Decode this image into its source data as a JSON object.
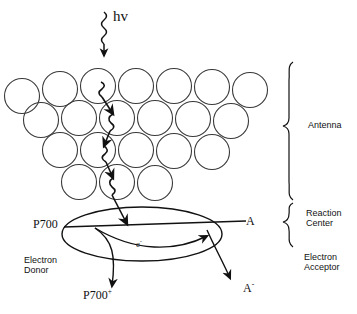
{
  "figure": {
    "background_color": "#ffffff",
    "stroke_color": "#111111"
  },
  "labels": {
    "photon": "hv",
    "p700": "P700",
    "p700_oxidized_base": "P700",
    "p700_oxidized_charge": "+",
    "acceptor": "A",
    "acceptor_reduced_base": "A",
    "acceptor_reduced_charge": "-",
    "electron_base": "e",
    "electron_charge": "-",
    "antenna": "Antenna",
    "reaction_center_line1": "Reaction",
    "reaction_center_line2": "Center",
    "electron_acceptor_line1": "Electron",
    "electron_acceptor_line2": "Acceptor",
    "electron_donor_line1": "Electron",
    "electron_donor_line2": "Donor"
  },
  "diagram_data": {
    "type": "schematic",
    "antenna": {
      "description": "Funnel-shaped array of open circles representing antenna pigment molecules",
      "circle_radius": 17.5,
      "circle_fill": "none",
      "circle_stroke": "#333333",
      "circle_stroke_width": 1.1,
      "rows": [
        {
          "row": 1,
          "count": 7,
          "cy": 96,
          "cx": [
            22,
            60,
            98,
            136,
            174,
            212,
            250
          ]
        },
        {
          "row": 2,
          "count": 6,
          "cy": 127,
          "cx": [
            41,
            79,
            117,
            155,
            193,
            231
          ]
        },
        {
          "row": 3,
          "count": 5,
          "cy": 158,
          "cx": [
            60,
            98,
            136,
            174,
            212
          ]
        },
        {
          "row": 4,
          "count": 3,
          "cy": 189,
          "cx": [
            79,
            117,
            155
          ]
        }
      ],
      "total_circles": 21
    },
    "reaction_center": {
      "shape": "ellipse",
      "cx": 142,
      "cy": 234,
      "rx": 80,
      "ry": 27,
      "stroke": "#111111",
      "fill": "none"
    },
    "photon_arrow": {
      "type": "wavy-arrow",
      "label": "hv",
      "x": 104,
      "y_start": 12,
      "y_end": 52,
      "direction": "down",
      "meaning": "incident light photon absorbed by antenna"
    },
    "energy_transfer_path": {
      "type": "zigzag-wavy-arrows",
      "arrowhead_count": 4,
      "description": "Excitation energy migrates downward through antenna pigments into the reaction center",
      "waypoints": [
        {
          "x": 104,
          "y": 85
        },
        {
          "x": 113,
          "y": 118
        },
        {
          "x": 106,
          "y": 150
        },
        {
          "x": 111,
          "y": 182
        },
        {
          "x": 125,
          "y": 222
        }
      ]
    },
    "electron_transfer": {
      "label": "e-",
      "from": "P700",
      "to": "A",
      "direction": "left-to-right",
      "description": "Charge separation: electron moves from P700 to acceptor A"
    },
    "donor_line": {
      "description": "Horizontal line entering ellipse on the left labeled P700, curving down to P700+",
      "x_start": 62,
      "x_end": 246,
      "y": 227
    },
    "products": [
      {
        "name": "P700+",
        "position": "bottom-left",
        "meaning": "oxidized reaction center chlorophyll"
      },
      {
        "name": "A-",
        "position": "bottom-right",
        "meaning": "reduced electron acceptor"
      }
    ],
    "braces": [
      {
        "label": "Antenna",
        "x": 290,
        "y_top": 62,
        "y_bottom": 200
      },
      {
        "label": "Reaction Center",
        "x": 290,
        "y_top": 202,
        "y_bottom": 248
      }
    ]
  }
}
